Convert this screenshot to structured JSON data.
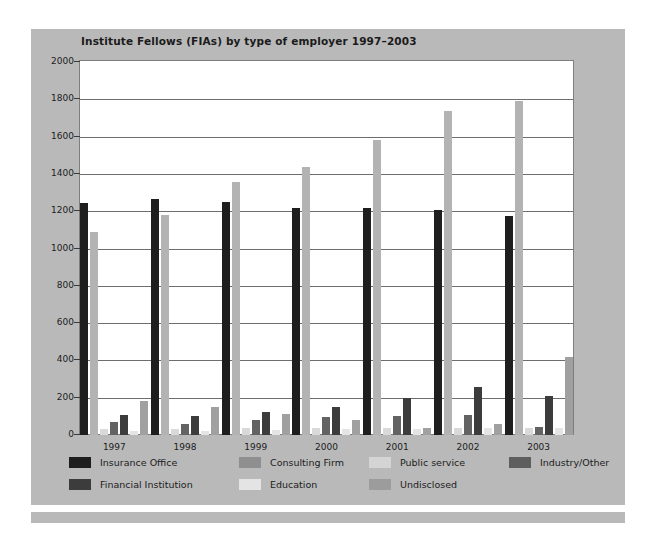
{
  "chart_data": {
    "type": "bar",
    "title": "Institute Fellows (FIAs) by type of employer 1997–2003",
    "xlabel": "",
    "ylabel": "",
    "ylim": [
      0,
      2000
    ],
    "ytick_step": 200,
    "yticks": [
      2000,
      1800,
      1600,
      1400,
      1200,
      1000,
      800,
      600,
      400,
      200,
      0
    ],
    "grid": true,
    "legend_position": "bottom",
    "categories": [
      "1997",
      "1998",
      "1999",
      "2000",
      "2001",
      "2002",
      "2003"
    ],
    "series": [
      {
        "name": "Insurance Office",
        "color": "#1e1e1e",
        "values": [
          1245,
          1265,
          1250,
          1215,
          1215,
          1205,
          1175
        ]
      },
      {
        "name": "Consulting Firm",
        "color": "#b3b3b3",
        "values": [
          1090,
          1180,
          1355,
          1435,
          1580,
          1735,
          1790
        ]
      },
      {
        "name": "Public service",
        "color": "#d9d9d9",
        "values": [
          30,
          30,
          35,
          35,
          35,
          40,
          40
        ]
      },
      {
        "name": "Industry/Other",
        "color": "#636363",
        "values": [
          70,
          60,
          80,
          95,
          100,
          105,
          45
        ]
      },
      {
        "name": "Financial Institution",
        "color": "#3c3c3c",
        "values": [
          105,
          100,
          125,
          150,
          200,
          260,
          210
        ]
      },
      {
        "name": "Education",
        "color": "#e4e4e4",
        "values": [
          20,
          20,
          25,
          30,
          30,
          35,
          35
        ]
      },
      {
        "name": "Undisclosed",
        "color": "#a0a0a0",
        "values": [
          185,
          150,
          115,
          80,
          40,
          60,
          420
        ]
      }
    ]
  },
  "legend": {
    "items": [
      {
        "label": "Insurance Office",
        "color": "#1e1e1e"
      },
      {
        "label": "Consulting Firm",
        "color": "#8f8f8f"
      },
      {
        "label": "Public service",
        "color": "#d4d4d4"
      },
      {
        "label": "Industry/Other",
        "color": "#5e5e5e"
      },
      {
        "label": "Financial Institution",
        "color": "#3c3c3c"
      },
      {
        "label": "Education",
        "color": "#e4e4e4"
      },
      {
        "label": "Undisclosed",
        "color": "#9c9c9c"
      }
    ]
  },
  "colors": {
    "panel_background": "#b9b9b9",
    "plot_background": "#ffffff",
    "gridline": "#6e6e6e",
    "text": "#1c1c1c"
  }
}
